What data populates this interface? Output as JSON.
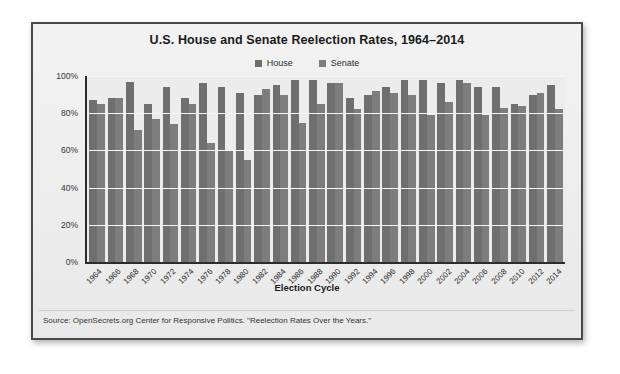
{
  "chart_data": {
    "type": "bar",
    "title": "U.S. House and Senate Reelection Rates, 1964–2014",
    "xlabel": "Election Cycle",
    "ylabel": "",
    "ylim": [
      0,
      100
    ],
    "yticks": [
      "0%",
      "20%",
      "40%",
      "60%",
      "80%",
      "100%"
    ],
    "ytick_values": [
      0,
      20,
      40,
      60,
      80,
      100
    ],
    "grid": true,
    "legend_position": "top-center",
    "categories": [
      "1964",
      "1966",
      "1968",
      "1970",
      "1972",
      "1974",
      "1976",
      "1978",
      "1980",
      "1982",
      "1984",
      "1986",
      "1988",
      "1990",
      "1992",
      "1994",
      "1996",
      "1998",
      "2000",
      "2002",
      "2004",
      "2006",
      "2008",
      "2010",
      "2012",
      "2014"
    ],
    "series": [
      {
        "name": "House",
        "color": "#6f6f6f",
        "values": [
          87,
          88,
          97,
          85,
          94,
          88,
          96,
          94,
          91,
          90,
          95,
          98,
          98,
          96,
          88,
          90,
          94,
          98,
          98,
          96,
          98,
          94,
          94,
          85,
          90,
          95
        ]
      },
      {
        "name": "Senate",
        "color": "#7d7d7d",
        "values": [
          85,
          88,
          71,
          77,
          74,
          85,
          64,
          60,
          55,
          93,
          90,
          75,
          85,
          96,
          82,
          92,
          91,
          90,
          79,
          86,
          96,
          79,
          83,
          84,
          91,
          82
        ]
      }
    ],
    "source": "Source: OpenSecrets.org Center for Responsive Politics. \"Reelection Rates Over the Years.\""
  },
  "legend": {
    "items": [
      {
        "label": "House",
        "color": "#6f6f6f"
      },
      {
        "label": "Senate",
        "color": "#7d7d7d"
      }
    ]
  }
}
